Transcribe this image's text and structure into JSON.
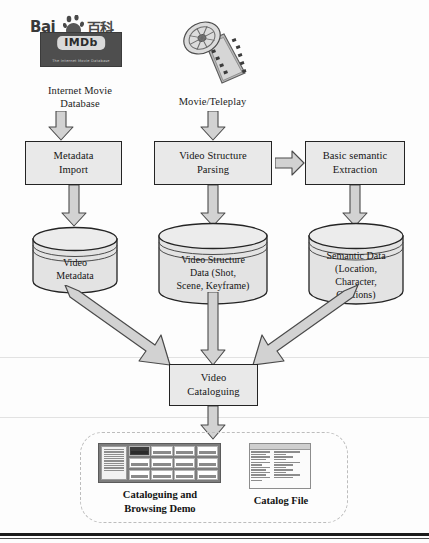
{
  "sources": [
    {
      "id": "imdb",
      "label_line1": "Internet Movie",
      "label_line2": "Database",
      "logo": {
        "icon": "baidu-baike-logo",
        "brand_text": "Bai",
        "brand_cn": "百科",
        "imdb_text": "IMDb",
        "imdb_tagline": "The Internet Movie Database"
      }
    },
    {
      "id": "movie",
      "label_line1": "Movie/Teleplay",
      "label_line2": "",
      "logo": {
        "icon": "film-reel-icon"
      }
    }
  ],
  "process_boxes": [
    {
      "id": "metadata-import",
      "line1": "Metadata",
      "line2": "Import"
    },
    {
      "id": "video-structure-parsing",
      "line1": "Video Structure",
      "line2": "Parsing"
    },
    {
      "id": "basic-semantic-extraction",
      "line1": "Basic semantic",
      "line2": "Extraction"
    },
    {
      "id": "video-cataloguing",
      "line1": "Video",
      "line2": "Cataloguing"
    }
  ],
  "datastores": [
    {
      "id": "video-metadata",
      "lines": [
        "Video",
        "Metadata"
      ]
    },
    {
      "id": "video-structure-data",
      "lines": [
        "Video Structure",
        "Data (Shot,",
        "Scene, Keyframe)"
      ]
    },
    {
      "id": "semantic-data",
      "lines": [
        "Semantic Data",
        "(Location,",
        "Character,",
        "Captions)"
      ]
    }
  ],
  "outputs": [
    {
      "id": "cataloguing-browsing-demo",
      "caption_line1": "Cataloguing and",
      "caption_line2": "Browsing Demo",
      "thumbnail": "browsing-app-screenshot"
    },
    {
      "id": "catalog-file",
      "caption_line1": "Catalog File",
      "caption_line2": "",
      "thumbnail": "catalog-file-screenshot"
    }
  ],
  "arrows": [
    {
      "id": "imdb-to-metadata-import",
      "direction": "down"
    },
    {
      "id": "movie-to-video-structure-parsing",
      "direction": "down"
    },
    {
      "id": "metadata-import-to-video-metadata",
      "direction": "down"
    },
    {
      "id": "parsing-to-semantic-extraction",
      "direction": "right"
    },
    {
      "id": "parsing-to-structure-data",
      "direction": "down"
    },
    {
      "id": "extraction-to-semantic-data",
      "direction": "down"
    },
    {
      "id": "video-metadata-to-cataloguing",
      "direction": "diagonal-down-right"
    },
    {
      "id": "structure-data-to-cataloguing",
      "direction": "down"
    },
    {
      "id": "semantic-data-to-cataloguing",
      "direction": "diagonal-down-left"
    },
    {
      "id": "cataloguing-to-demo",
      "direction": "down"
    }
  ],
  "colors": {
    "shape_fill": "#e9e9e9",
    "shape_stroke": "#242424",
    "arrow_fill": "#d2d2d2",
    "arrow_stroke": "#4a4a4a",
    "dashed_border": "#bdbdbd",
    "text": "#151515",
    "rule": "#1b1b1b"
  }
}
